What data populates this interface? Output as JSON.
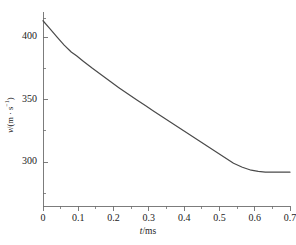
{
  "chart_data": {
    "type": "line",
    "title": "",
    "xlabel": "t/ms",
    "ylabel": "v/(m · s⁻¹)",
    "xlim": [
      0,
      0.7
    ],
    "ylim": [
      265,
      420
    ],
    "grid": false,
    "legend": null,
    "x_ticks": [
      "0",
      "0.1",
      "0.2",
      "0.3",
      "0.4",
      "0.5",
      "0.6",
      "0.7"
    ],
    "x_tick_values": [
      0,
      0.1,
      0.2,
      0.3,
      0.4,
      0.5,
      0.6,
      0.7
    ],
    "x_minor_tick_values": [
      0.05,
      0.15,
      0.25,
      0.35,
      0.45,
      0.55,
      0.65
    ],
    "y_ticks": [
      "300",
      "350",
      "400"
    ],
    "y_tick_values": [
      300,
      350,
      400
    ],
    "y_minor_tick_values": [
      275,
      325,
      375,
      415
    ],
    "line_color": "#4a4a4a",
    "line_width": 1.2,
    "axis_color": "#6e6e6e",
    "series": [
      {
        "name": "velocity",
        "x": [
          0.0,
          0.02,
          0.04,
          0.06,
          0.08,
          0.095,
          0.115,
          0.14,
          0.165,
          0.19,
          0.215,
          0.24,
          0.265,
          0.29,
          0.315,
          0.34,
          0.365,
          0.39,
          0.415,
          0.44,
          0.465,
          0.49,
          0.515,
          0.54,
          0.565,
          0.59,
          0.61,
          0.63,
          0.65,
          0.67,
          0.7
        ],
        "y": [
          413.0,
          406.5,
          400.0,
          393.5,
          388.0,
          385.0,
          380.5,
          375.0,
          369.8,
          364.6,
          359.5,
          354.6,
          349.8,
          345.2,
          340.6,
          336.0,
          331.4,
          326.8,
          322.2,
          317.6,
          313.0,
          308.4,
          303.8,
          299.2,
          296.0,
          293.6,
          292.6,
          292.0,
          292.0,
          292.0,
          292.0
        ]
      }
    ]
  },
  "axis_titles": {
    "x": "t/ms",
    "y_var": "v",
    "y_unit": "/(m · s"
  }
}
